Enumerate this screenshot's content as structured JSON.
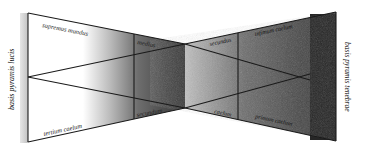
{
  "diagram": {
    "labels": {
      "left_base": "basis pyramis lucis",
      "right_base": "basis pyramis tenebrae",
      "top_left": "supremus mundus",
      "top_mid": "medius",
      "top_dark_inner": "secundus",
      "top_dark_outer": "infimum caelum",
      "bottom_left": "tertium caelum",
      "bottom_mid": "secundum",
      "bottom_dark_inner": "caelum",
      "bottom_dark_outer": "primum caelum"
    },
    "colors": {
      "line": "#1a1a1a",
      "light": "#ffffff",
      "dark": "#2b2b2b",
      "darkest": "#1c1c1c",
      "left_band": "#c8c8c8"
    }
  }
}
